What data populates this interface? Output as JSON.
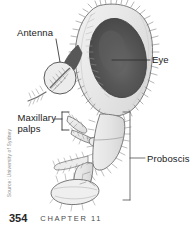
{
  "figure": {
    "labels": {
      "antenna": "Antenna",
      "eye": "Eye",
      "maxillary_line1": "Maxillary",
      "maxillary_line2": "palps",
      "proboscis": "Proboscis"
    },
    "callouts": [
      {
        "name": "antenna",
        "text": "Antenna",
        "style": "leader-line-to-circle-inset"
      },
      {
        "name": "eye",
        "text": "Eye",
        "style": "leader-line"
      },
      {
        "name": "maxillary-palps",
        "text": "Maxillary palps",
        "style": "bracket"
      },
      {
        "name": "proboscis",
        "text": "Proboscis",
        "style": "bracket"
      }
    ],
    "colors": {
      "background": "#ffffff",
      "head_fill": "#e3e3e3",
      "head_fill_light": "#f1f1f1",
      "eye_dark": "#4d4d4d",
      "eye_mid": "#5c5c5c",
      "eye_highlight": "#6e6e6e",
      "outline": "#6f6f6f",
      "bristle": "#7a7a7a",
      "leader_line": "#3a3a3a",
      "label_text": "#1a1a1a",
      "credit_text": "#8a8a8a",
      "page_number_text": "#262626",
      "chapter_text": "#4a4a4a"
    }
  },
  "credit": {
    "text": "Source: University of Sydney"
  },
  "footer": {
    "page_number": "354",
    "chapter_label": "CHAPTER 11"
  }
}
